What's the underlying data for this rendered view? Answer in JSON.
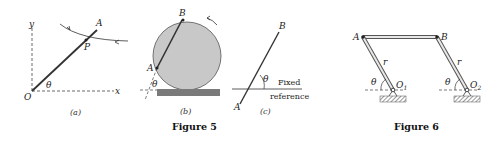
{
  "figure5": {
    "caption": "Figure 5",
    "panel_a": {
      "caption": "(a)",
      "axis_x": "x",
      "axis_y": "y",
      "origin": "O",
      "point_A": "A",
      "point_P": "P",
      "angle": "θ"
    },
    "panel_b": {
      "caption": "(b)",
      "point_A": "A",
      "point_B": "B",
      "angle": "θ"
    },
    "panel_c": {
      "caption": "(c)",
      "point_A": "A",
      "point_B": "B",
      "angle": "θ",
      "reference_line1": "Fixed",
      "reference_line2": "reference"
    }
  },
  "figure6": {
    "caption": "Figure 6",
    "point_A": "A",
    "point_B": "B",
    "pivot1": "O",
    "pivot1_sub": "1",
    "pivot2": "O",
    "pivot2_sub": "2",
    "link_label_left": "r",
    "link_label_right": "r",
    "angle_left": "θ",
    "angle_right": "θ"
  },
  "colors": {
    "line": "#333333",
    "disk_fill": "#c8c8c8",
    "ground": "#7a7a7a",
    "link_fill": "#e8e8e8"
  }
}
